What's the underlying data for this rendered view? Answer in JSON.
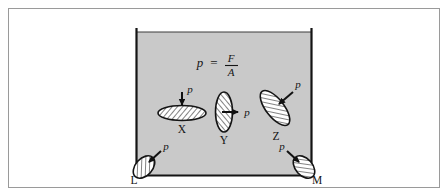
{
  "figure": {
    "name": "pressure-in-fluid-diagram",
    "outer_frame": {
      "x": 8,
      "y": 8,
      "width": 432,
      "height": 180,
      "stroke": "#9a9a9a",
      "fill": "#ffffff"
    },
    "vessel": {
      "name": "liquid-container",
      "left": 136,
      "right": 311,
      "top": 31,
      "bottom": 175,
      "fill_color": "#c9c9c9",
      "wall_color": "#1a1a1a",
      "surface_label": ""
    },
    "formula": {
      "text": "p = F/A",
      "p": "p",
      "equals": "=",
      "numerator": "F",
      "denominator": "A",
      "x": 225,
      "y": 62
    },
    "elements": [
      {
        "id": "X",
        "label": "X",
        "arrow_label": "p",
        "orientation": "horizontal",
        "description": "horizontal hatched disc with downward pressure arrow",
        "cx": 182,
        "cy": 113,
        "rx": 24,
        "ry": 7,
        "rotation": 0,
        "label_x": 182,
        "label_y": 131,
        "arrow_from": [
          182,
          94
        ],
        "arrow_to": [
          182,
          106
        ],
        "arrow_label_x": 190,
        "arrow_label_y": 91
      },
      {
        "id": "Y",
        "label": "Y",
        "arrow_label": "p",
        "orientation": "vertical",
        "description": "vertical hatched disc with rightward pressure arrow",
        "cx": 224,
        "cy": 112,
        "rx": 8,
        "ry": 20,
        "rotation": 0,
        "label_x": 224,
        "label_y": 142,
        "arrow_from": [
          224,
          112
        ],
        "arrow_to": [
          240,
          112
        ],
        "arrow_label_x": 248,
        "arrow_label_y": 112
      },
      {
        "id": "Z",
        "label": "Z",
        "arrow_label": "p",
        "orientation": "tilted",
        "description": "tilted hatched disc with oblique pressure arrow",
        "cx": 275,
        "cy": 108,
        "rx": 9,
        "ry": 21,
        "rotation": -38,
        "label_x": 275,
        "label_y": 138,
        "arrow_from": [
          292,
          92
        ],
        "arrow_to": [
          277,
          106
        ],
        "arrow_label_x": 297,
        "arrow_label_y": 85
      },
      {
        "id": "L",
        "label": "L",
        "arrow_label": "p",
        "orientation": "corner-left",
        "description": "hatched element at bottom-left corner with arrow pointing down-left",
        "cx": 143,
        "cy": 167,
        "rx": 8,
        "ry": 13,
        "rotation": 40,
        "label_x": 135,
        "label_y": 181,
        "arrow_from": [
          160,
          152
        ],
        "arrow_to": [
          147,
          164
        ],
        "arrow_label_x": 165,
        "arrow_label_y": 147
      },
      {
        "id": "M",
        "label": "M",
        "arrow_label": "p",
        "orientation": "corner-right",
        "description": "hatched element at bottom-right corner with arrow pointing down-right",
        "cx": 305,
        "cy": 167,
        "rx": 8,
        "ry": 13,
        "rotation": -40,
        "label_x": 314,
        "label_y": 181,
        "arrow_from": [
          288,
          152
        ],
        "arrow_to": [
          301,
          164
        ],
        "arrow_label_x": 283,
        "arrow_label_y": 147
      }
    ]
  }
}
